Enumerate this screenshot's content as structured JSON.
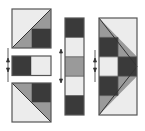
{
  "diagram": {
    "colors": {
      "dark": "#3a3a3a",
      "medium": "#9a9a9a",
      "light": "#ececec",
      "outline": "#555555",
      "arrow": "#333333"
    },
    "panels": [
      {
        "id": "half-square-top",
        "description": "Square with light upper-left triangle, gray lower-left triangle and dark lower-right quarter"
      },
      {
        "id": "two-patch-strip",
        "description": "Dark square joined to light square"
      },
      {
        "id": "half-square-bottom",
        "description": "Square with gray upper-left, dark upper-right, gray lower-right triangle, light lower-left triangle"
      },
      {
        "id": "five-patch-column",
        "description": "Column of five squares: dark, light, gray, light, dark"
      },
      {
        "id": "flying-geese-block",
        "description": "Assembled block with dark checkerboard squares framed by gray and light triangles"
      }
    ],
    "arrows": [
      {
        "id": "left-join-arrows",
        "direction": "up-down"
      },
      {
        "id": "middle-join-arrows",
        "direction": "up-down"
      },
      {
        "id": "right-join-arrows",
        "direction": "up-down"
      }
    ]
  }
}
